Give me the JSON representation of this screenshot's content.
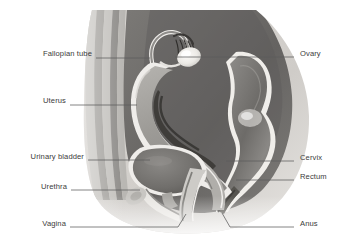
{
  "figure": {
    "background_color": "#ffffff",
    "label_color": "#3b3b3b",
    "leader_color": "#5c5c5c"
  },
  "palette": {
    "skin_outer": "#d9d6d2",
    "skin_pale": "#e8e6e3",
    "wall_band_light": "#c3c1bd",
    "wall_band_mid": "#a9a7a3",
    "wall_band_dark": "#8e8c89",
    "cavity_dark": "#6f6d6b",
    "cavity_darker": "#565451",
    "organ_mid": "#9b9996",
    "organ_light": "#cfcdc9",
    "highlight": "#f2f0ec",
    "lumen_black": "#3a3836"
  },
  "labels": [
    {
      "id": "fallopian-tube",
      "text": "Fallopian tube",
      "side": "left",
      "x": 8,
      "y": 54,
      "leader_from_x": 96,
      "leader_to_x": 150,
      "leader_y": 58
    },
    {
      "id": "uterus",
      "text": "Uterus",
      "side": "left",
      "x": 27,
      "y": 101,
      "leader_from_x": 70,
      "leader_to_x": 137,
      "leader_y": 105
    },
    {
      "id": "urinary-bladder",
      "text": "Urinary bladder",
      "side": "left",
      "x": 8,
      "y": 157,
      "leader_from_x": 88,
      "leader_to_x": 150,
      "leader_y": 160
    },
    {
      "id": "urethra",
      "text": "Urethra",
      "side": "left",
      "x": 30,
      "y": 187,
      "leader_from_x": 71,
      "leader_to_x": 140,
      "leader_y": 190
    },
    {
      "id": "vagina",
      "text": "Vagina",
      "side": "left",
      "x": 30,
      "y": 224,
      "leader_from_x": 70,
      "leader_to_x": 178,
      "leader_y": 227
    },
    {
      "id": "ovary",
      "text": "Ovary",
      "side": "right",
      "x": 300,
      "y": 53,
      "leader_from_x": 294,
      "leader_to_x": 175,
      "leader_y": 57
    },
    {
      "id": "cervix",
      "text": "Cervix",
      "side": "right",
      "x": 300,
      "y": 158,
      "leader_from_x": 294,
      "leader_to_x": 226,
      "leader_y": 161
    },
    {
      "id": "rectum",
      "text": "Rectum",
      "side": "right",
      "x": 300,
      "y": 177,
      "leader_from_x": 294,
      "leader_to_x": 236,
      "leader_y": 180
    },
    {
      "id": "anus",
      "text": "Anus",
      "side": "right",
      "x": 300,
      "y": 224,
      "leader_from_x": 294,
      "leader_to_x": 230,
      "leader_y": 227
    }
  ],
  "structures": [
    {
      "id": "abdominal-wall",
      "name": "Abdominal wall layers"
    },
    {
      "id": "fallopian-tube",
      "name": "Fallopian tube with fimbriae"
    },
    {
      "id": "ovary",
      "name": "Ovary"
    },
    {
      "id": "uterus",
      "name": "Uterus with endometrial cavity"
    },
    {
      "id": "urinary-bladder",
      "name": "Urinary bladder"
    },
    {
      "id": "urethra",
      "name": "Urethra"
    },
    {
      "id": "vagina",
      "name": "Vagina"
    },
    {
      "id": "cervix",
      "name": "Cervix"
    },
    {
      "id": "rectum",
      "name": "Rectum"
    },
    {
      "id": "anus",
      "name": "Anus"
    }
  ]
}
